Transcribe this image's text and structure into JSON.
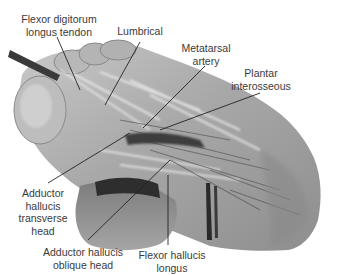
{
  "figure": {
    "labels": [
      {
        "id": "flexor-digitorum-longus-tendon",
        "lines": [
          "Flexor digitorum",
          "longus tendon"
        ]
      },
      {
        "id": "lumbrical",
        "lines": [
          "Lumbrical"
        ]
      },
      {
        "id": "metatarsal-artery",
        "lines": [
          "Metatarsal",
          "artery"
        ]
      },
      {
        "id": "plantar-interosseous",
        "lines": [
          "Plantar",
          "interosseous"
        ]
      },
      {
        "id": "adductor-hallucis-transverse-head",
        "lines": [
          "Adductor",
          "hallucis",
          "transverse",
          "head"
        ]
      },
      {
        "id": "adductor-hallucis-oblique-head",
        "lines": [
          "Adductor hallucis",
          "oblique head"
        ]
      },
      {
        "id": "flexor-hallucis-longus",
        "lines": [
          "Flexor hallucis",
          "longus"
        ]
      }
    ],
    "colors": {
      "background": "#ffffff",
      "label_text": "#3a3a3a",
      "leader_line": "#222222",
      "tissue_light": "#d9d9d9",
      "tissue_mid": "#9a9a9a",
      "tissue_dark": "#3c3c3c"
    }
  }
}
